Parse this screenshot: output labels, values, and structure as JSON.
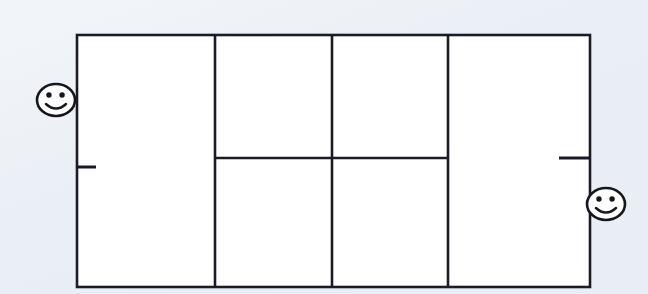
{
  "scene": {
    "title": "Tennis court diagram with two players",
    "background_color": "#eef2f7",
    "line_color": "#1b1b26",
    "court_fill": "#ffffff",
    "width": 648,
    "height": 294
  },
  "court": {
    "label": "tennis-court",
    "outline": {
      "x": 77,
      "y": 35,
      "width": 513,
      "height": 252
    },
    "vertical_lines": [
      {
        "name": "left-singles-sideline",
        "x": 215,
        "y1": 35,
        "y2": 287
      },
      {
        "name": "center-line",
        "x": 332,
        "y1": 35,
        "y2": 287
      },
      {
        "name": "right-singles-sideline",
        "x": 448,
        "y1": 35,
        "y2": 287
      }
    ],
    "horizontal_lines": [
      {
        "name": "service-line",
        "x1": 215,
        "x2": 448,
        "y": 158
      }
    ],
    "ticks": [
      {
        "name": "left-center-mark",
        "x1": 77,
        "x2": 96,
        "y": 167
      },
      {
        "name": "right-center-mark",
        "x1": 559,
        "x2": 590,
        "y": 158
      }
    ]
  },
  "players": [
    {
      "name": "player-left",
      "expression": "smiling",
      "center_x": 56,
      "center_y": 100,
      "radius_x": 19,
      "radius_y": 16,
      "side": "left"
    },
    {
      "name": "player-right",
      "expression": "smiling",
      "center_x": 606,
      "center_y": 204,
      "radius_x": 19,
      "radius_y": 16,
      "side": "right"
    }
  ]
}
